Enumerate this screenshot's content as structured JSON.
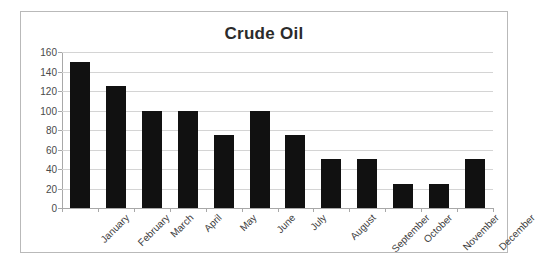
{
  "chart_data": {
    "type": "bar",
    "title": "Crude Oil",
    "xlabel": "",
    "ylabel": "",
    "categories": [
      "January",
      "February",
      "March",
      "April",
      "May",
      "June",
      "July",
      "August",
      "September",
      "October",
      "November",
      "December"
    ],
    "values": [
      150,
      125,
      100,
      100,
      75,
      100,
      75,
      50,
      50,
      25,
      25,
      50
    ],
    "ylim": [
      0,
      160
    ],
    "ytick_labels": [
      "160",
      "140",
      "120",
      "100",
      "80",
      "60",
      "40",
      "20",
      "0"
    ],
    "ytick_values": [
      160,
      140,
      120,
      100,
      80,
      60,
      40,
      20,
      0
    ],
    "grid": true,
    "legend": false,
    "bar_color": "#111111",
    "gridline_color": "#d4d4d4",
    "axis_color": "#a8a8a8",
    "title_color": "#2b2b2b",
    "plot_background": "#ffffff",
    "frame_border_color": "#b9b9b9",
    "xtick_label_rotation": -45
  }
}
